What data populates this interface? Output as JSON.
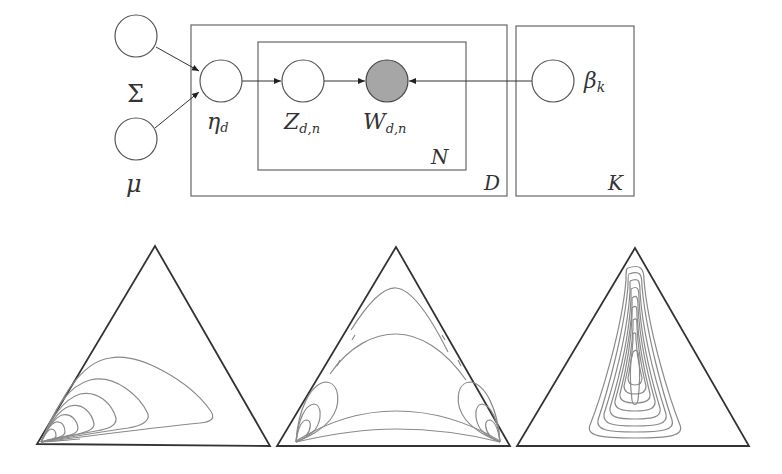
{
  "diagram": {
    "type": "plate-notation graphical model with simplex contour plots",
    "nodes": [
      {
        "id": "sigma",
        "label": "Σ",
        "observed": false,
        "fill": "#ffffff"
      },
      {
        "id": "mu",
        "label": "μ",
        "observed": false,
        "fill": "#ffffff"
      },
      {
        "id": "eta",
        "label": "η",
        "sub": "d",
        "observed": false,
        "fill": "#ffffff"
      },
      {
        "id": "z",
        "label": "Z",
        "sub": "d,n",
        "observed": false,
        "fill": "#ffffff"
      },
      {
        "id": "w",
        "label": "W",
        "sub": "d,n",
        "observed": true,
        "fill": "#a6a6a6"
      },
      {
        "id": "beta",
        "label": "β",
        "sub": "k",
        "observed": false,
        "fill": "#ffffff"
      }
    ],
    "edges": [
      {
        "from": "sigma",
        "to": "eta"
      },
      {
        "from": "mu",
        "to": "eta"
      },
      {
        "from": "eta",
        "to": "z"
      },
      {
        "from": "z",
        "to": "w"
      },
      {
        "from": "beta",
        "to": "w"
      }
    ],
    "plates": [
      {
        "id": "N",
        "label": "N",
        "contains": [
          "z",
          "w"
        ]
      },
      {
        "id": "D",
        "label": "D",
        "contains": [
          "eta",
          "z",
          "w"
        ]
      },
      {
        "id": "K",
        "label": "K",
        "contains": [
          "beta"
        ]
      }
    ],
    "labels": {
      "sigma": "Σ",
      "mu": "μ",
      "eta": "η",
      "eta_sub": "d",
      "z": "Z",
      "z_sub": "d,n",
      "w": "W",
      "w_sub": "d,n",
      "beta": "β",
      "beta_sub": "k",
      "plate_n": "N",
      "plate_d": "D",
      "plate_k": "K"
    },
    "simplex_plots": [
      {
        "id": "simplex-1",
        "description": "contours concentrated at bottom-left corner, extending rightward"
      },
      {
        "id": "simplex-2",
        "description": "contours concentrated at both bottom corners, with arcs spanning the triangle"
      },
      {
        "id": "simplex-3",
        "description": "nested elongated teardrop contours centered vertically"
      }
    ],
    "colors": {
      "observed_fill": "#a6a6a6",
      "line": "#333333",
      "contour": "#8a8a8a"
    }
  }
}
